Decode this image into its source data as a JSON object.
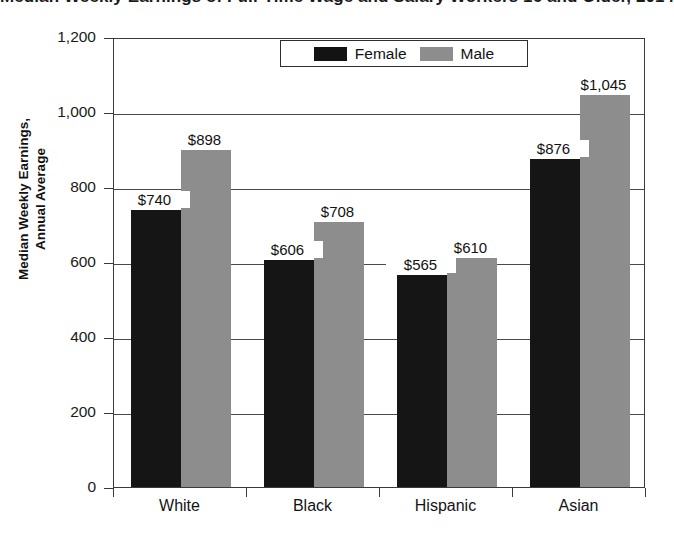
{
  "chart_data": {
    "type": "bar",
    "title": "Median Weekly Earnings of Full-Time Wage and Salary Workers 16 and Older, 2014",
    "xlabel": "",
    "ylabel": "Median Weekly Earnings,\nAnnual Average",
    "ylabel_line1": "Median Weekly Earnings,",
    "ylabel_line2": "Annual Average",
    "categories": [
      "White",
      "Black",
      "Hispanic",
      "Asian"
    ],
    "series": [
      {
        "name": "Female",
        "color": "#151515",
        "values": [
          740,
          606,
          565,
          876
        ],
        "labels": [
          "$740",
          "$606",
          "$565",
          "$876"
        ]
      },
      {
        "name": "Male",
        "color": "#8d8d8d",
        "values": [
          898,
          708,
          610,
          1045
        ],
        "labels": [
          "$898",
          "$708",
          "$610",
          "$1,045"
        ]
      }
    ],
    "ylim": [
      0,
      1200
    ],
    "yticks": [
      0,
      200,
      400,
      600,
      800,
      1000,
      1200
    ],
    "ytick_labels": [
      "0",
      "200",
      "400",
      "600",
      "800",
      "1,000",
      "1,200"
    ],
    "grid": true,
    "legend_position": "top-center"
  }
}
